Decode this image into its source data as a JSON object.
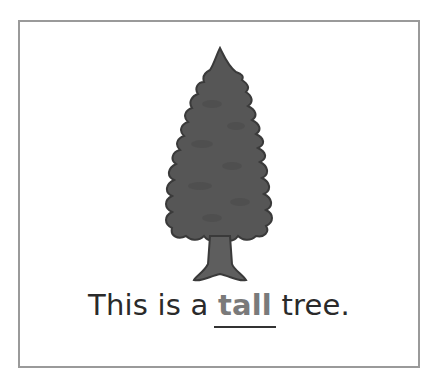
{
  "worksheet": {
    "image": {
      "subject": "tree",
      "icon": "pine-tree-illustration",
      "fill": "#555555",
      "outline": "#3a3a3a"
    },
    "sentence": {
      "before": "This is a ",
      "highlight": "tall",
      "after": " tree."
    },
    "colors": {
      "border": "#9a9a9a",
      "text": "#2a2a2a",
      "highlight": "#7a7a7a"
    }
  }
}
